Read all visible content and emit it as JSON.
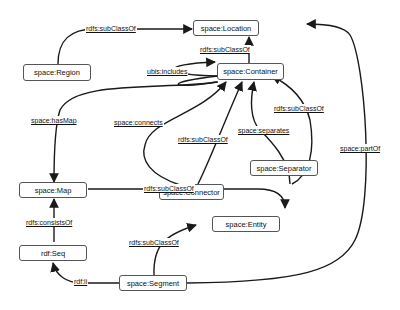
{
  "diagram": {
    "nodes": {
      "location": "space:Location",
      "region": "space:Region",
      "container": "space:Container",
      "map": "space:Map",
      "connector": "space:Connector",
      "separator": "space:Separator",
      "entity": "space:Entity",
      "seq": "rdf:Seq",
      "segment": "space:Segment"
    },
    "edges": [
      {
        "from": "space:Region",
        "to": "space:Location",
        "label": "rdfs:subClassOf"
      },
      {
        "from": "space:Container",
        "to": "space:Location",
        "label": "rdfs:subClassOf"
      },
      {
        "from": "space:Container",
        "to": "space:Container",
        "label": "ubis:includes"
      },
      {
        "from": "space:Container",
        "to": "space:Map",
        "label": "space:hasMap"
      },
      {
        "from": "space:Connector",
        "to": "space:Container",
        "label": "space:connects"
      },
      {
        "from": "space:Connector",
        "to": "space:Container",
        "label": "rdfs:subClassOf"
      },
      {
        "from": "space:Separator",
        "to": "space:Container",
        "label": "space:separates"
      },
      {
        "from": "space:Separator",
        "to": "space:Container",
        "label": "rdfs:subClassOf"
      },
      {
        "from": "space:Segment",
        "to": "space:Location",
        "label": "space:partOf"
      },
      {
        "from": "space:Map",
        "to": "space:Entity",
        "label": "rdfs:subClassOf"
      },
      {
        "from": "space:Segment",
        "to": "space:Entity",
        "label": "rdfs:subClassOf"
      },
      {
        "from": "rdf:Seq",
        "to": "space:Map",
        "label": "rdfs:consistsOf"
      },
      {
        "from": "space:Segment",
        "to": "rdf:Seq",
        "label": "rdf:li"
      }
    ]
  }
}
